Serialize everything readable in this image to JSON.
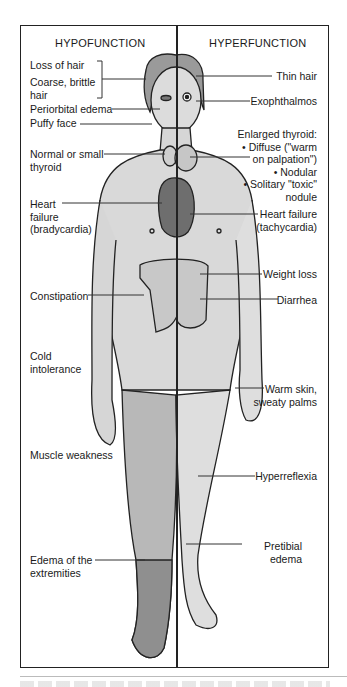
{
  "headers": {
    "left": "HYPOFUNCTION",
    "right": "HYPERFUNCTION"
  },
  "hypofunction_labels": [
    {
      "text": "Loss of hair"
    },
    {
      "text": "Coarse, brittle\nhair"
    },
    {
      "text": "Periorbital edema"
    },
    {
      "text": "Puffy face"
    },
    {
      "text": "Normal or small\nthyroid"
    },
    {
      "text": "Heart\nfailure\n(bradycardia)"
    },
    {
      "text": "Constipation"
    },
    {
      "text": "Cold\nintolerance"
    },
    {
      "text": "Muscle weakness"
    },
    {
      "text": "Edema of the\nextremities"
    }
  ],
  "hyperfunction_labels": [
    {
      "text": "Thin hair"
    },
    {
      "text": "Exophthalmos"
    },
    {
      "text": "Enlarged thyroid:\n• Diffuse (\"warm\non palpation\")\n• Nodular\n• Solitary \"toxic\"\nnodule"
    },
    {
      "text": "Heart failure\n(tachycardia)"
    },
    {
      "text": "Weight loss"
    },
    {
      "text": "Diarrhea"
    },
    {
      "text": "Warm skin,\nsweaty palms"
    },
    {
      "text": "Hyperreflexia"
    },
    {
      "text": "Pretibial\nedema"
    }
  ],
  "colors": {
    "skin_left": "#d6d6d6",
    "skin_right": "#dedede",
    "heart": "#6e6e6e",
    "edema_leg": "#8f8f8f",
    "outline": "#222222"
  }
}
